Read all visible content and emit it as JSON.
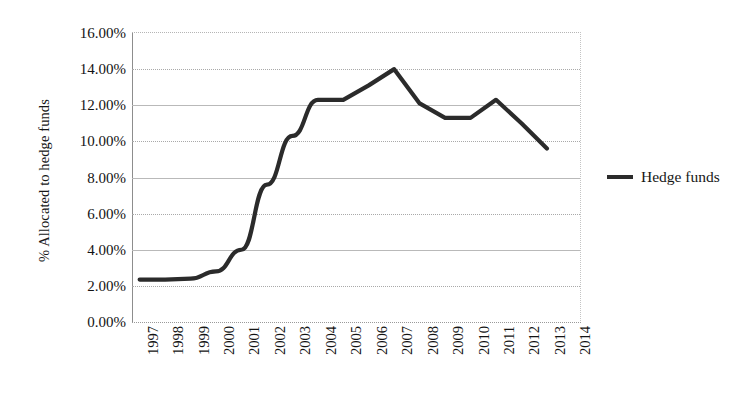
{
  "chart_data": {
    "type": "line",
    "title": "",
    "xlabel": "",
    "ylabel": "% Allocated to hedge funds",
    "categories": [
      "1997",
      "1998",
      "1999",
      "2000",
      "2001",
      "2002",
      "2003",
      "2004",
      "2005",
      "2006",
      "2007",
      "2008",
      "2009",
      "2010",
      "2011",
      "2012",
      "2013",
      "2014"
    ],
    "series": [
      {
        "name": "Hedge funds",
        "color": "#2b2b2b",
        "values": [
          2.35,
          2.35,
          2.4,
          2.8,
          4.0,
          7.6,
          10.3,
          12.3,
          12.3,
          13.1,
          14.0,
          12.1,
          11.3,
          11.3,
          12.3,
          11.0,
          9.6,
          null
        ]
      }
    ],
    "ylim": [
      0,
      16
    ],
    "ytick_values": [
      0,
      2,
      4,
      6,
      8,
      10,
      12,
      14,
      16
    ],
    "ytick_labels": [
      "0.00%",
      "2.00%",
      "4.00%",
      "6.00%",
      "8.00%",
      "10.00%",
      "12.00%",
      "14.00%",
      "16.00%"
    ],
    "grid": true,
    "grid_style": "dotted-horizontal",
    "legend_position": "right",
    "legend": [
      "Hedge funds"
    ]
  },
  "axis": {
    "y_title": "% Allocated to hedge funds"
  },
  "legend": {
    "entries": [
      {
        "label": "Hedge funds",
        "swatch_color": "#2b2b2b"
      }
    ]
  }
}
